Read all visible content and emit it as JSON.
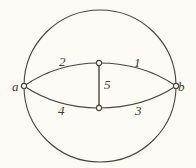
{
  "figure": {
    "name": "circle-with-inscribed-lens-graph",
    "background_color": "#fdfbf6",
    "ink_color": "#4a4638",
    "circle": {
      "center_x": 100,
      "center_y": 86,
      "radius": 76
    },
    "vertices": [
      {
        "id": "a",
        "label": "a",
        "x": 24,
        "y": 86,
        "marker": "open-circle"
      },
      {
        "id": "b",
        "label": "b",
        "x": 176,
        "y": 86,
        "marker": "open-circle"
      },
      {
        "id": "m_top",
        "label": "",
        "x": 99,
        "y": 63,
        "marker": "open-circle"
      },
      {
        "id": "m_bottom",
        "label": "",
        "x": 99,
        "y": 108,
        "marker": "open-circle"
      }
    ],
    "edges": [
      {
        "id": "1",
        "label": "1",
        "from": "m_top",
        "to": "b",
        "shape": "arc-up"
      },
      {
        "id": "2",
        "label": "2",
        "from": "a",
        "to": "m_top",
        "shape": "arc-up"
      },
      {
        "id": "3",
        "label": "3",
        "from": "m_bottom",
        "to": "b",
        "shape": "arc-down"
      },
      {
        "id": "4",
        "label": "4",
        "from": "a",
        "to": "m_bottom",
        "shape": "arc-down"
      },
      {
        "id": "5",
        "label": "5",
        "from": "m_top",
        "to": "m_bottom",
        "shape": "straight"
      }
    ]
  }
}
